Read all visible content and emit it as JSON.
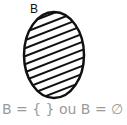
{
  "diagram": {
    "set_label": "B",
    "shape": "ellipse",
    "fill": "diagonal-hatch",
    "stroke_color": "#111111",
    "caption": "B  =  { } ou B  =  ∅",
    "caption_color": "#9a9a9a"
  }
}
